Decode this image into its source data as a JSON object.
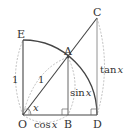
{
  "diagram": {
    "type": "unit-circle-trig",
    "points": {
      "O": {
        "label": "O",
        "x": 23,
        "y": 115
      },
      "B": {
        "label": "B",
        "x": 68,
        "y": 115
      },
      "D": {
        "label": "D",
        "x": 97,
        "y": 115
      },
      "E": {
        "label": "E",
        "x": 23,
        "y": 40
      },
      "A": {
        "label": "A",
        "x": 68,
        "y": 57
      },
      "C": {
        "label": "C",
        "x": 97,
        "y": 18
      }
    },
    "labels": {
      "O": "O",
      "B": "B",
      "D": "D",
      "E": "E",
      "A": "A",
      "C": "C",
      "radius_left": "1",
      "radius_oa": "1",
      "angle": "x",
      "cos": "cos",
      "sin": "sin",
      "tan": "tan",
      "var": "x"
    },
    "colors": {
      "line": "#444444",
      "dashed": "#aaaaaa",
      "text": "#333333"
    }
  }
}
